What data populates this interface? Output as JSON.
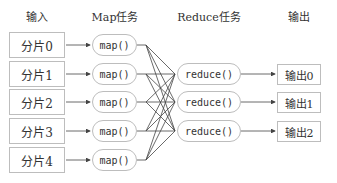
{
  "headers": {
    "input": "输入",
    "map": "Map任务",
    "reduce": "Reduce任务",
    "output": "输出"
  },
  "inputs": [
    "分片0",
    "分片1",
    "分片2",
    "分片3",
    "分片4"
  ],
  "map_tasks": [
    "map()",
    "map()",
    "map()",
    "map()",
    "map()"
  ],
  "reduce_tasks": [
    "reduce()",
    "reduce()",
    "reduce()"
  ],
  "outputs": [
    "输出0",
    "输出1",
    "输出2"
  ],
  "colors": {
    "line": "#444444",
    "border": "#bdbdbd",
    "text": "#333333"
  }
}
